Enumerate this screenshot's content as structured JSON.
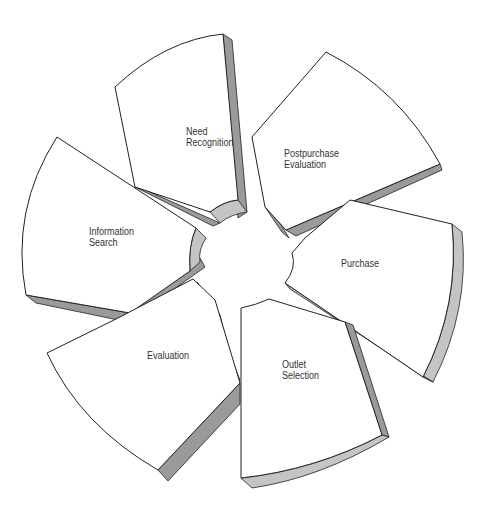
{
  "diagram": {
    "type": "segmented-cycle",
    "segments": [
      {
        "id": "need-recognition",
        "label": "Need\nRecognition"
      },
      {
        "id": "postpurchase-evaluation",
        "label": "Postpurchase\nEvaluation"
      },
      {
        "id": "purchase",
        "label": "Purchase"
      },
      {
        "id": "outlet-selection",
        "label": "Outlet\nSelection"
      },
      {
        "id": "evaluation",
        "label": "Evaluation"
      },
      {
        "id": "information-search",
        "label": "Information\nSearch"
      }
    ],
    "colors": {
      "face": "#ffffff",
      "side_dark": "#9a9a9a",
      "side_light": "#c4c4c4",
      "outline": "#222222",
      "text": "#333333"
    }
  }
}
